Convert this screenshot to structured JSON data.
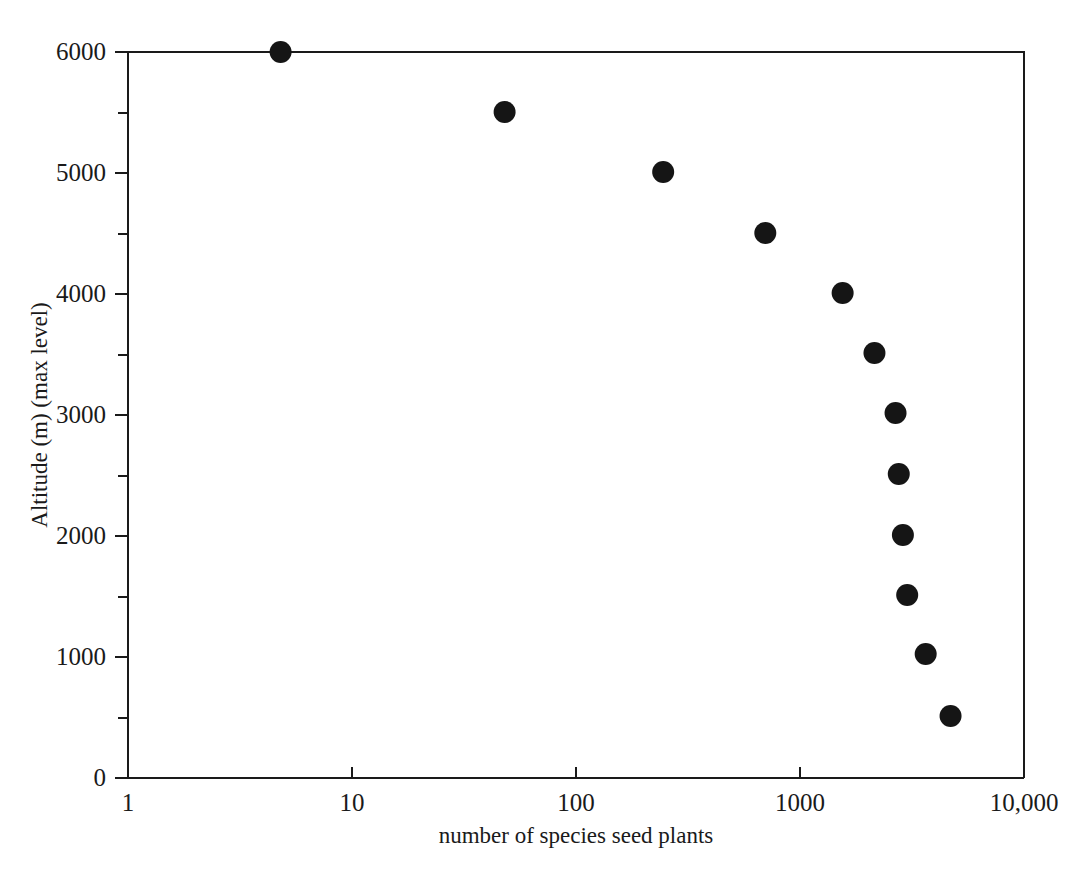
{
  "chart_data": {
    "type": "scatter",
    "title": "",
    "xlabel": "number of species seed plants",
    "ylabel": "Altitude (m) (max level)",
    "x_scale": "log",
    "y_scale": "linear",
    "xlim": [
      1,
      10000
    ],
    "ylim": [
      0,
      6000
    ],
    "grid": false,
    "legend": null,
    "x_tick_labels": [
      "1",
      "10",
      "100",
      "1000",
      "10,000"
    ],
    "x_tick_values": [
      1,
      10,
      100,
      1000,
      10000
    ],
    "y_tick_labels": [
      "0",
      "1000",
      "2000",
      "3000",
      "4000",
      "5000",
      "6000"
    ],
    "y_tick_values": [
      0,
      1000,
      2000,
      3000,
      4000,
      5000,
      6000
    ],
    "y_minor_tick_values": [
      500,
      1500,
      2500,
      3500,
      4500,
      5500
    ],
    "marker": {
      "shape": "circle",
      "color": "#151515",
      "size_px": 11
    },
    "series": [
      {
        "name": "max altitude vs species richness",
        "points": [
          {
            "x": 4.8,
            "y": 6000
          },
          {
            "x": 48,
            "y": 5504
          },
          {
            "x": 245,
            "y": 5008
          },
          {
            "x": 700,
            "y": 4504
          },
          {
            "x": 1550,
            "y": 4008
          },
          {
            "x": 2150,
            "y": 3512
          },
          {
            "x": 2670,
            "y": 3017
          },
          {
            "x": 2760,
            "y": 2512
          },
          {
            "x": 2880,
            "y": 2008
          },
          {
            "x": 3010,
            "y": 1512
          },
          {
            "x": 3640,
            "y": 1025
          },
          {
            "x": 4700,
            "y": 512
          }
        ]
      }
    ]
  },
  "figure": {
    "background_color": "#ffffff",
    "axis_color": "#1a1a1a"
  }
}
